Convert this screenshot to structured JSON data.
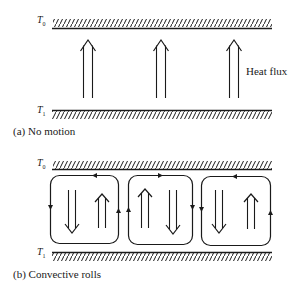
{
  "panel_a": {
    "caption": "(a) No motion",
    "top_label": "T",
    "top_sub": "0",
    "bottom_label": "T",
    "bottom_sub": "1",
    "annotation": "Heat flux",
    "arrows": [
      {
        "x": 88,
        "direction": "up"
      },
      {
        "x": 161,
        "direction": "up"
      },
      {
        "x": 234,
        "direction": "up"
      }
    ]
  },
  "panel_b": {
    "caption": "(b) Convective rolls",
    "top_label": "T",
    "top_sub": "0",
    "bottom_label": "T",
    "bottom_sub": "1",
    "rolls": [
      {
        "id": 1,
        "circulation": "counter-clockwise",
        "left_arrow": "down",
        "right_arrow": "up"
      },
      {
        "id": 2,
        "circulation": "clockwise",
        "left_arrow": "up",
        "right_arrow": "down"
      },
      {
        "id": 3,
        "circulation": "counter-clockwise",
        "left_arrow": "down",
        "right_arrow": "up"
      }
    ]
  },
  "colors": {
    "ink": "#1a1a1a",
    "background": "#ffffff"
  }
}
